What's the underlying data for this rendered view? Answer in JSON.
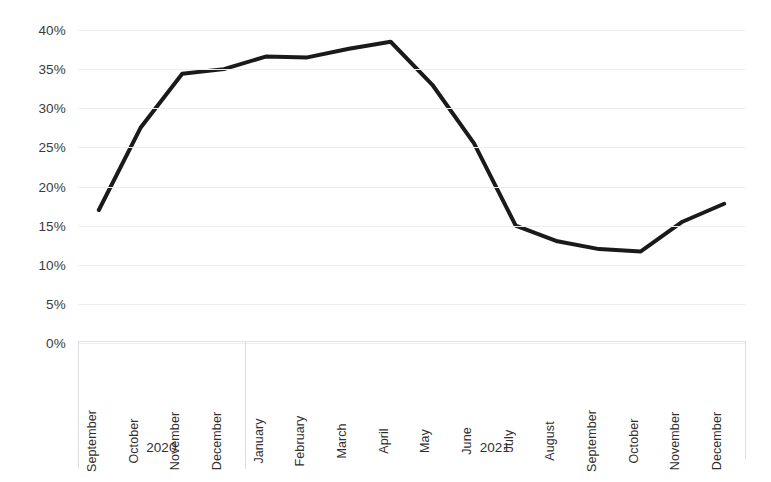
{
  "chart_data": {
    "type": "line",
    "title": "",
    "subtitle": "",
    "xlabel": "",
    "ylabel": "",
    "ylim": [
      0,
      40
    ],
    "ytick_labels": [
      "40%",
      "35%",
      "30%",
      "25%",
      "20%",
      "15%",
      "10%",
      "5%",
      "0%"
    ],
    "ytick_values": [
      40,
      35,
      30,
      25,
      20,
      15,
      10,
      5,
      0
    ],
    "grid": true,
    "legend": "none",
    "line_color": "#1a1a1a",
    "line_width": 4,
    "gridline_color": "#ececf1",
    "categories": [
      "September",
      "October",
      "November",
      "December",
      "January",
      "February",
      "March",
      "April",
      "May",
      "June",
      "July",
      "August",
      "September",
      "October",
      "November",
      "December"
    ],
    "values": [
      17.0,
      27.5,
      34.4,
      35.0,
      36.6,
      36.5,
      37.6,
      38.5,
      33.0,
      25.5,
      15.0,
      13.0,
      12.0,
      11.7,
      15.5,
      17.8
    ],
    "groups": [
      {
        "label": "2020",
        "start_index": 0,
        "end_index": 3
      },
      {
        "label": "2021",
        "start_index": 4,
        "end_index": 15
      }
    ]
  }
}
